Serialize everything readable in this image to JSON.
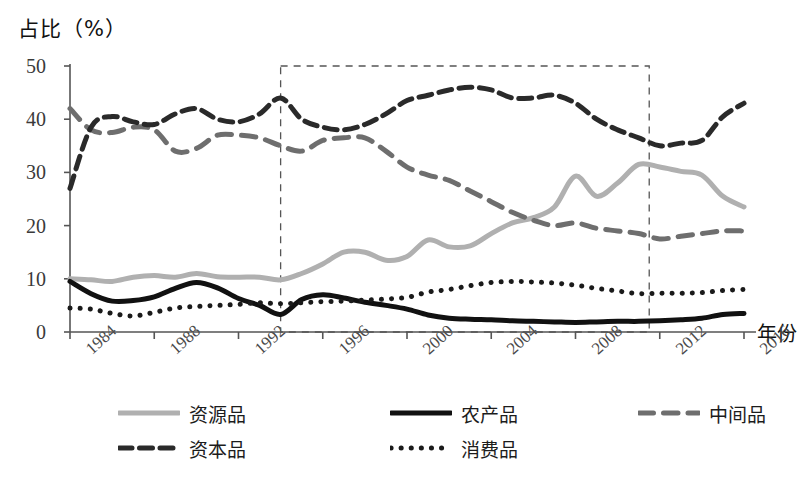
{
  "chart_data": {
    "type": "line",
    "title": "",
    "ylabel": "占比（%）",
    "xlabel": "年份",
    "ylim": [
      0,
      50
    ],
    "yticks": [
      0,
      10,
      20,
      30,
      40,
      50
    ],
    "xticks": [
      "1984",
      "1988",
      "1992",
      "1996",
      "2000",
      "2004",
      "2008",
      "2012",
      "2016"
    ],
    "x": [
      1984,
      1985,
      1986,
      1987,
      1988,
      1989,
      1990,
      1991,
      1992,
      1993,
      1994,
      1995,
      1996,
      1997,
      1998,
      1999,
      2000,
      2001,
      2002,
      2003,
      2004,
      2005,
      2006,
      2007,
      2008,
      2009,
      2010,
      2011,
      2012,
      2013,
      2014,
      2015,
      2016
    ],
    "grid": false,
    "legend_position": "bottom",
    "annotations": [
      {
        "type": "dashed-rect",
        "x_start": 1994,
        "x_end": 2011.5,
        "y_start": 0,
        "y_end": 50
      }
    ],
    "series": [
      {
        "name": "资源品",
        "style": "solid",
        "color": "#b0b0b0",
        "width": 5,
        "values": [
          10.0,
          9.8,
          9.5,
          10.3,
          10.6,
          10.3,
          11.0,
          10.4,
          10.3,
          10.3,
          9.8,
          11.0,
          12.8,
          15.0,
          15.0,
          13.5,
          14.2,
          17.3,
          16.0,
          16.2,
          18.5,
          20.5,
          21.5,
          23.5,
          29.3,
          25.5,
          28.0,
          31.5,
          31.0,
          30.2,
          29.5,
          25.5,
          23.5
        ]
      },
      {
        "name": "农产品",
        "style": "solid",
        "color": "#111111",
        "width": 5,
        "values": [
          9.5,
          7.2,
          5.8,
          5.9,
          6.6,
          8.2,
          9.3,
          8.3,
          6.3,
          5.0,
          3.3,
          6.1,
          7.0,
          6.4,
          5.6,
          5.0,
          4.3,
          3.2,
          2.6,
          2.4,
          2.3,
          2.1,
          2.0,
          1.9,
          1.8,
          1.9,
          2.0,
          2.0,
          2.1,
          2.3,
          2.6,
          3.3,
          3.5
        ]
      },
      {
        "name": "中间品",
        "style": "dashed-wide",
        "color": "#6e6e6e",
        "width": 5,
        "values": [
          42.0,
          38.0,
          37.5,
          38.5,
          38.0,
          34.0,
          34.5,
          37.0,
          37.0,
          36.5,
          35.0,
          34.0,
          36.0,
          36.5,
          36.5,
          34.0,
          31.0,
          29.5,
          28.5,
          26.5,
          24.5,
          22.5,
          21.0,
          20.0,
          20.5,
          19.5,
          19.0,
          18.5,
          17.5,
          18.0,
          18.5,
          19.0,
          19.0
        ]
      },
      {
        "name": "资本品",
        "style": "dashed",
        "color": "#2a2a2a",
        "width": 5,
        "values": [
          27.0,
          38.5,
          40.5,
          39.5,
          39.0,
          41.0,
          42.0,
          40.0,
          39.5,
          41.0,
          44.0,
          40.0,
          38.5,
          38.0,
          39.0,
          41.0,
          43.5,
          44.5,
          45.5,
          46.0,
          45.5,
          44.0,
          44.0,
          44.5,
          43.0,
          40.0,
          38.0,
          36.5,
          35.0,
          35.5,
          36.0,
          40.5,
          43.0
        ]
      },
      {
        "name": "消费品",
        "style": "dotted",
        "color": "#1a1a1a",
        "width": 5,
        "values": [
          4.5,
          4.3,
          3.5,
          3.0,
          3.7,
          4.5,
          4.8,
          5.0,
          5.2,
          5.5,
          5.3,
          5.5,
          5.7,
          5.8,
          6.0,
          6.2,
          6.5,
          7.5,
          8.0,
          8.7,
          9.3,
          9.5,
          9.4,
          9.2,
          8.8,
          8.2,
          7.7,
          7.2,
          7.3,
          7.3,
          7.4,
          7.8,
          8.0
        ]
      }
    ]
  },
  "legend": {
    "rows": [
      [
        {
          "label": "资源品",
          "series": "资源品"
        },
        {
          "label": "农产品",
          "series": "农产品"
        },
        {
          "label": "中间品",
          "series": "中间品"
        }
      ],
      [
        {
          "label": "资本品",
          "series": "资本品"
        },
        {
          "label": "消费品",
          "series": "消费品"
        }
      ]
    ]
  },
  "colors": {
    "resource": "#b0b0b0",
    "agriculture": "#111111",
    "intermediate": "#6e6e6e",
    "capital": "#2a2a2a",
    "consumer": "#1a1a1a",
    "axis": "#555555",
    "annotation": "#555555"
  }
}
